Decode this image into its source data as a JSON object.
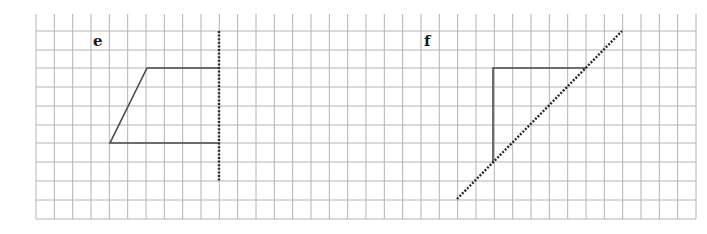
{
  "grid": {
    "x0": 36,
    "x1": 696,
    "y_top": 14,
    "y_bottom": 219,
    "cols": 36,
    "h_lines": [
      31,
      50,
      68,
      87,
      106,
      125,
      143,
      162,
      181,
      200,
      219
    ],
    "color": "#b4b4b4"
  },
  "figures": [
    {
      "label": "e",
      "label_pos": [
        93,
        46
      ],
      "shape_points": [
        [
          219,
          68
        ],
        [
          147,
          68
        ],
        [
          110,
          143
        ],
        [
          219,
          143
        ]
      ],
      "mirror_line": [
        [
          219,
          31
        ],
        [
          219,
          181
        ]
      ]
    },
    {
      "label": "f",
      "label_pos": [
        424,
        46
      ],
      "shape_points": [
        [
          586,
          68
        ],
        [
          493,
          68
        ],
        [
          493,
          162
        ]
      ],
      "mirror_line": [
        [
          457,
          199
        ],
        [
          622,
          31
        ]
      ]
    }
  ],
  "colors": {
    "shape": "#4a4a4a",
    "mirror": "#2a2a2a",
    "label": "#1a1a1a"
  }
}
